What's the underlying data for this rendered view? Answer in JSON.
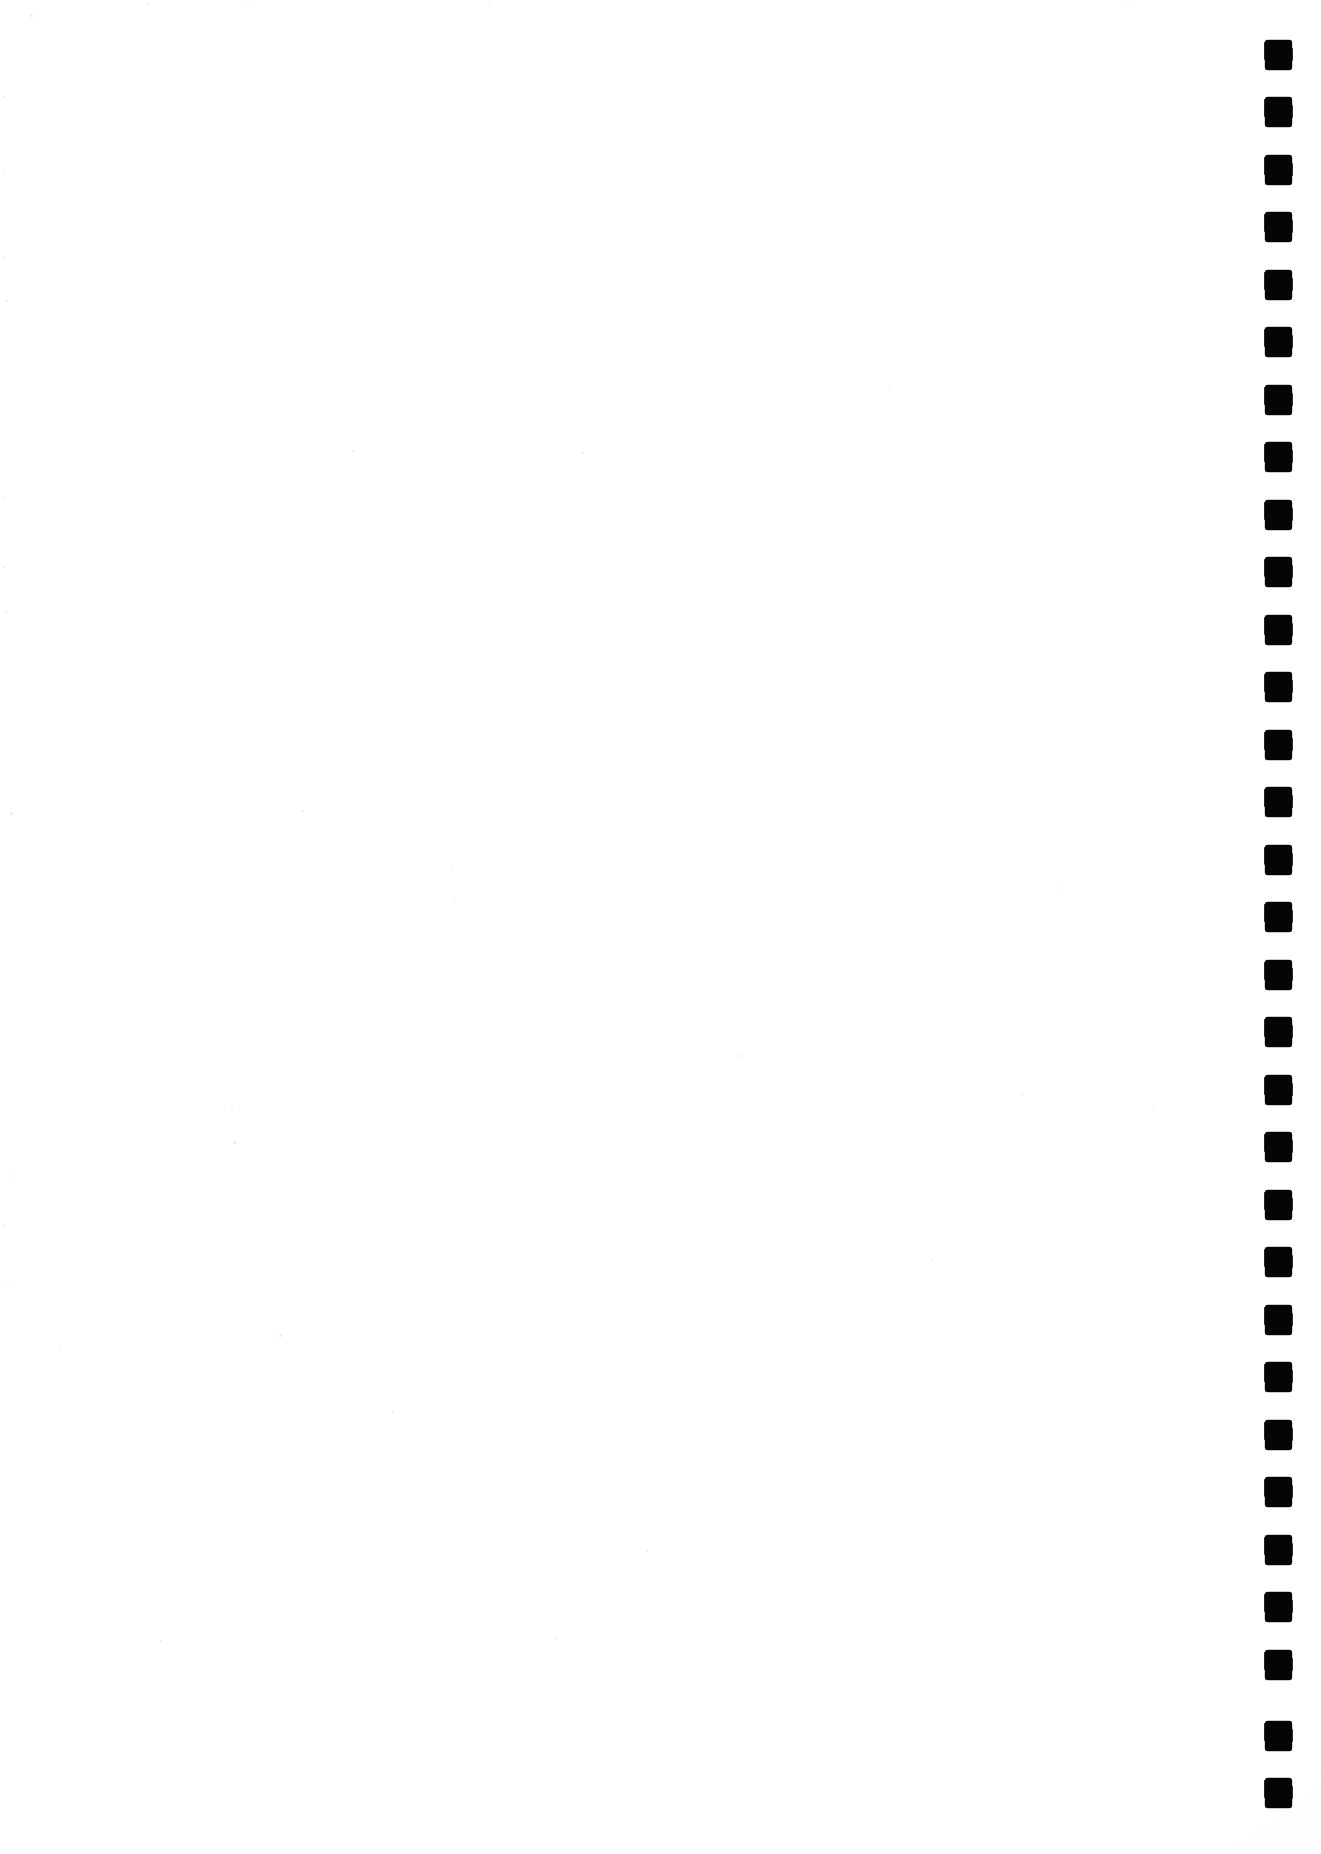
{
  "document": {
    "kind": "scanned-page",
    "page_content": "",
    "visible_text": "",
    "background_color": "#ffffff",
    "page_width_px": 1321,
    "page_height_px": 1854
  },
  "registration_strip": {
    "label": "",
    "mark_color": "#050505",
    "mark_count": 31,
    "mark_width_px": 27,
    "mark_height_px": 30,
    "first_mark_top_px": 40,
    "mark_pitch_px": 57.5,
    "mark_left_px": 1265,
    "marks": [
      {
        "index": 1,
        "top": 40
      },
      {
        "index": 2,
        "top": 97
      },
      {
        "index": 3,
        "top": 155
      },
      {
        "index": 4,
        "top": 212
      },
      {
        "index": 5,
        "top": 270
      },
      {
        "index": 6,
        "top": 327
      },
      {
        "index": 7,
        "top": 385
      },
      {
        "index": 8,
        "top": 442
      },
      {
        "index": 9,
        "top": 500
      },
      {
        "index": 10,
        "top": 557
      },
      {
        "index": 11,
        "top": 615
      },
      {
        "index": 12,
        "top": 672
      },
      {
        "index": 13,
        "top": 730
      },
      {
        "index": 14,
        "top": 787
      },
      {
        "index": 15,
        "top": 845
      },
      {
        "index": 16,
        "top": 902
      },
      {
        "index": 17,
        "top": 960
      },
      {
        "index": 18,
        "top": 1017
      },
      {
        "index": 19,
        "top": 1075
      },
      {
        "index": 20,
        "top": 1132
      },
      {
        "index": 21,
        "top": 1190
      },
      {
        "index": 22,
        "top": 1247
      },
      {
        "index": 23,
        "top": 1305
      },
      {
        "index": 24,
        "top": 1362
      },
      {
        "index": 25,
        "top": 1420
      },
      {
        "index": 26,
        "top": 1477
      },
      {
        "index": 27,
        "top": 1535
      },
      {
        "index": 28,
        "top": 1592
      },
      {
        "index": 29,
        "top": 1650
      },
      {
        "index": 30,
        "top": 1721
      },
      {
        "index": 31,
        "top": 1778
      }
    ]
  },
  "scan_artifacts": {
    "speckles": [
      {
        "x": 30,
        "y": 14,
        "size": 3
      },
      {
        "x": 146,
        "y": 3,
        "size": 2
      },
      {
        "x": 247,
        "y": 6,
        "size": 2
      },
      {
        "x": 489,
        "y": 2,
        "size": 2
      },
      {
        "x": 3,
        "y": 96,
        "size": 2
      },
      {
        "x": 2,
        "y": 170,
        "size": 2
      },
      {
        "x": 4,
        "y": 256,
        "size": 2
      },
      {
        "x": 6,
        "y": 300,
        "size": 2
      },
      {
        "x": 352,
        "y": 450,
        "size": 2
      },
      {
        "x": 4,
        "y": 497,
        "size": 2
      },
      {
        "x": 3,
        "y": 566,
        "size": 2
      },
      {
        "x": 5,
        "y": 611,
        "size": 2
      },
      {
        "x": 582,
        "y": 452,
        "size": 2
      },
      {
        "x": 10,
        "y": 812,
        "size": 3
      },
      {
        "x": 302,
        "y": 810,
        "size": 2
      },
      {
        "x": 452,
        "y": 866,
        "size": 2
      },
      {
        "x": 453,
        "y": 900,
        "size": 2
      },
      {
        "x": 231,
        "y": 1106,
        "size": 2
      },
      {
        "x": 233,
        "y": 1141,
        "size": 3
      },
      {
        "x": 11,
        "y": 1175,
        "size": 2
      },
      {
        "x": 3,
        "y": 1225,
        "size": 2
      },
      {
        "x": 7,
        "y": 1283,
        "size": 2
      },
      {
        "x": 60,
        "y": 1348,
        "size": 2
      },
      {
        "x": 279,
        "y": 1334,
        "size": 3
      },
      {
        "x": 392,
        "y": 1411,
        "size": 2
      },
      {
        "x": 646,
        "y": 1550,
        "size": 2
      },
      {
        "x": 160,
        "y": 1640,
        "size": 2
      },
      {
        "x": 554,
        "y": 1638,
        "size": 2
      },
      {
        "x": 1021,
        "y": 1093,
        "size": 2
      },
      {
        "x": 931,
        "y": 1260,
        "size": 2
      },
      {
        "x": 1059,
        "y": 887,
        "size": 2
      },
      {
        "x": 740,
        "y": 1055,
        "size": 2
      },
      {
        "x": 1127,
        "y": 6,
        "size": 2
      },
      {
        "x": 889,
        "y": 386,
        "size": 2
      },
      {
        "x": 1153,
        "y": 1108,
        "size": 2
      }
    ]
  }
}
